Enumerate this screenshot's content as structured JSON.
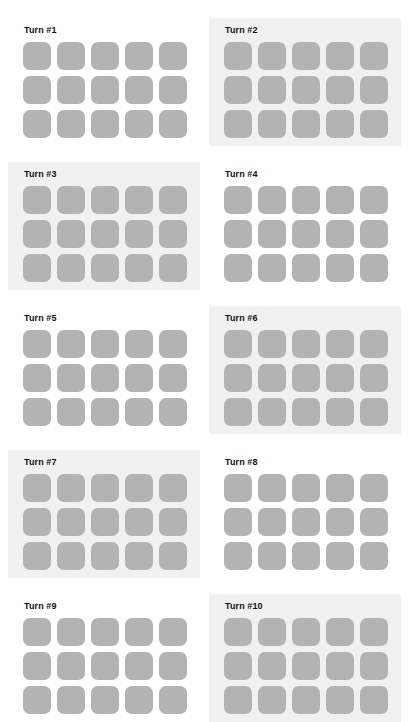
{
  "board": {
    "columns": 2,
    "rows": 5,
    "grid_columns": 5,
    "grid_rows": 3,
    "tile_color": "#b3b3b3",
    "shaded_panel_color": "#f1f1f1",
    "plain_panel_color": "#ffffff",
    "title_color": "#111111",
    "panels": [
      {
        "label": "Turn #1",
        "shaded": false,
        "left": 8,
        "top": 18
      },
      {
        "label": "Turn #2",
        "shaded": true,
        "left": 209,
        "top": 18
      },
      {
        "label": "Turn #3",
        "shaded": true,
        "left": 8,
        "top": 162
      },
      {
        "label": "Turn #4",
        "shaded": false,
        "left": 209,
        "top": 162
      },
      {
        "label": "Turn #5",
        "shaded": false,
        "left": 8,
        "top": 306
      },
      {
        "label": "Turn #6",
        "shaded": true,
        "left": 209,
        "top": 306
      },
      {
        "label": "Turn #7",
        "shaded": true,
        "left": 8,
        "top": 450
      },
      {
        "label": "Turn #8",
        "shaded": false,
        "left": 209,
        "top": 450
      },
      {
        "label": "Turn #9",
        "shaded": false,
        "left": 8,
        "top": 594
      },
      {
        "label": "Turn #10",
        "shaded": true,
        "left": 209,
        "top": 594
      }
    ]
  }
}
